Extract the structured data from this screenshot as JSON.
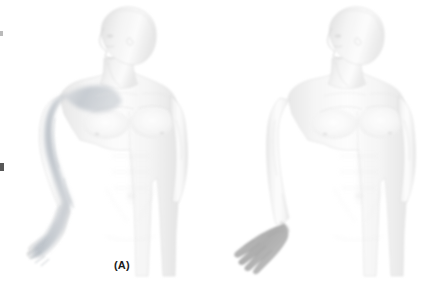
{
  "figure": {
    "background_color": "#ffffff",
    "width": 440,
    "height": 300,
    "panels": [
      {
        "id": "A",
        "label": "(A)",
        "subject": "anterior male figure, head turned to left",
        "shaded_region": "lateral shoulder, deltoid, lateral arm, lateral forearm and hand",
        "shade_color": "#b8bfc6",
        "body_color": "#efefef"
      },
      {
        "id": "B",
        "label": "(B)",
        "subject": "anterior male figure, head turned to left",
        "shaded_region": "hand only",
        "shade_color": "#b5b5b5",
        "body_color": "#f1f1f1"
      }
    ]
  },
  "colors": {
    "outline": "#d8d8d8",
    "shadow": "#e3e3e3",
    "highlight": "#fafafa",
    "label_text": "#1a1a1a",
    "shade_arm": "#b9c0c7",
    "shade_hand": "#b3b3b3",
    "edge_artifact": "#3a3a3a"
  }
}
